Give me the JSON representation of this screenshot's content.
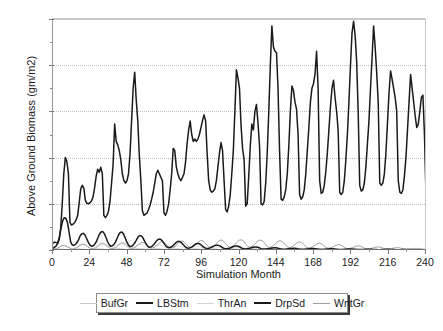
{
  "chart_data": {
    "type": "line",
    "title": "",
    "xlabel": "Simulation Month",
    "ylabel": "Above Ground Biomass (gm/m2)",
    "xlim": [
      0,
      240
    ],
    "ylim": [
      0,
      1000
    ],
    "xticks": [
      0,
      24,
      48,
      72,
      96,
      120,
      144,
      168,
      192,
      216,
      240
    ],
    "yticks": [
      0,
      200,
      400,
      600,
      800,
      1000
    ],
    "yticks_minor": [
      100,
      300,
      500,
      700,
      900
    ],
    "grid": "horizontal-dotted",
    "legend_position": "below-plot",
    "series": [
      {
        "name": "BufGr",
        "color": "#c8c8c8",
        "width": 0.8,
        "values": [
          1,
          2,
          3,
          4,
          5,
          4,
          3,
          2,
          1,
          1,
          1,
          1,
          1,
          2,
          3,
          4,
          5,
          5,
          4,
          3,
          2,
          1,
          1,
          1,
          1,
          2,
          3,
          5,
          6,
          6,
          5,
          4,
          3,
          2,
          1,
          1,
          1,
          2,
          3,
          5,
          6,
          7,
          6,
          5,
          4,
          3,
          2,
          1,
          1,
          2,
          3,
          5,
          6,
          7,
          7,
          6,
          5,
          4,
          3,
          2,
          1,
          2,
          3,
          5,
          6,
          7,
          7,
          6,
          5,
          4,
          3,
          2,
          1,
          2,
          3,
          5,
          6,
          7,
          6,
          5,
          4,
          3,
          2,
          1,
          1,
          2,
          3,
          4,
          6,
          6,
          6,
          5,
          4,
          3,
          2,
          1,
          1,
          2,
          3,
          4,
          5,
          6,
          5,
          4,
          3,
          2,
          2,
          1,
          1,
          2,
          3,
          4,
          5,
          5,
          5,
          4,
          3,
          2,
          1,
          1,
          1,
          2,
          3,
          4,
          5,
          5,
          4,
          4,
          3,
          2,
          1,
          1,
          1,
          2,
          3,
          4,
          4,
          5,
          4,
          3,
          3,
          2,
          1,
          1,
          1,
          2,
          3,
          3,
          4,
          4,
          4,
          3,
          2,
          2,
          1,
          1,
          1,
          2,
          2,
          3,
          3,
          4,
          3,
          3,
          2,
          1,
          1,
          1,
          1,
          2,
          2,
          3,
          3,
          3,
          3,
          2,
          2,
          1,
          1,
          1,
          1,
          2,
          2,
          2,
          3,
          3,
          2,
          2,
          2,
          1,
          1,
          1,
          1,
          1,
          2,
          2,
          2,
          2,
          2,
          2,
          1,
          1,
          1,
          1,
          1,
          1,
          2,
          2,
          2,
          2,
          2,
          2,
          1,
          1,
          1,
          1,
          1,
          1,
          1,
          1,
          2,
          2,
          2,
          2,
          1,
          1,
          1,
          1,
          1,
          1,
          1,
          1,
          1,
          1,
          1
        ]
      },
      {
        "name": "LBStm",
        "color": "#1a1a1a",
        "width": 1.5,
        "values": [
          30,
          34,
          32,
          30,
          45,
          95,
          200,
          330,
          400,
          382,
          330,
          120,
          108,
          112,
          118,
          130,
          150,
          205,
          265,
          280,
          268,
          215,
          202,
          200,
          205,
          212,
          230,
          270,
          320,
          350,
          336,
          358,
          330,
          150,
          140,
          150,
          168,
          210,
          290,
          370,
          545,
          470,
          455,
          430,
          390,
          330,
          300,
          290,
          300,
          330,
          420,
          560,
          700,
          770,
          650,
          560,
          410,
          300,
          170,
          150,
          155,
          160,
          175,
          195,
          220,
          250,
          290,
          330,
          345,
          330,
          315,
          300,
          160,
          150,
          168,
          200,
          260,
          330,
          440,
          430,
          360,
          330,
          310,
          300,
          315,
          330,
          380,
          460,
          520,
          558,
          500,
          470,
          480,
          470,
          480,
          500,
          530,
          560,
          585,
          560,
          420,
          300,
          260,
          250,
          255,
          265,
          300,
          360,
          420,
          465,
          430,
          300,
          175,
          165,
          190,
          240,
          330,
          430,
          600,
          780,
          745,
          700,
          540,
          440,
          390,
          190,
          200,
          320,
          450,
          545,
          520,
          600,
          630,
          550,
          450,
          200,
          195,
          210,
          290,
          420,
          600,
          800,
          970,
          880,
          860,
          855,
          700,
          430,
          220,
          215,
          230,
          260,
          330,
          450,
          600,
          710,
          690,
          640,
          610,
          500,
          240,
          220,
          230,
          260,
          330,
          430,
          530,
          640,
          700,
          720,
          760,
          860,
          700,
          300,
          245,
          250,
          280,
          340,
          420,
          520,
          620,
          700,
          735,
          660,
          600,
          520,
          250,
          240,
          250,
          300,
          390,
          500,
          640,
          800,
          940,
          990,
          930,
          820,
          600,
          280,
          255,
          260,
          290,
          360,
          460,
          560,
          700,
          830,
          970,
          880,
          770,
          640,
          290,
          280,
          290,
          330,
          420,
          550,
          680,
          775,
          740,
          700,
          660,
          600,
          300,
          250,
          245,
          260,
          320,
          400,
          520,
          640,
          760,
          700,
          640,
          580,
          530,
          545,
          600,
          660,
          670,
          500,
          240
        ]
      },
      {
        "name": "ThrAn",
        "color": "#d2d2d2",
        "width": 0.8,
        "values": [
          2,
          3,
          5,
          8,
          12,
          16,
          20,
          22,
          20,
          16,
          12,
          8,
          5,
          6,
          9,
          13,
          18,
          23,
          27,
          28,
          25,
          20,
          14,
          9,
          6,
          8,
          12,
          17,
          22,
          27,
          30,
          30,
          27,
          21,
          15,
          10,
          6,
          8,
          11,
          16,
          21,
          25,
          28,
          28,
          25,
          20,
          14,
          9,
          6,
          7,
          10,
          14,
          18,
          22,
          25,
          25,
          22,
          18,
          13,
          8,
          5,
          6,
          9,
          12,
          16,
          19,
          21,
          21,
          19,
          15,
          11,
          7,
          4,
          5,
          7,
          10,
          13,
          16,
          18,
          18,
          16,
          13,
          9,
          6,
          4,
          5,
          7,
          9,
          12,
          14,
          16,
          16,
          14,
          11,
          8,
          5,
          3,
          4,
          6,
          8,
          10,
          12,
          13,
          13,
          12,
          9,
          7,
          5,
          3,
          4,
          5,
          7,
          9,
          11,
          12,
          12,
          10,
          8,
          6,
          4,
          3,
          3,
          4,
          6,
          8,
          9,
          10,
          10,
          9,
          7,
          5,
          3,
          2,
          3,
          4,
          5,
          7,
          8,
          9,
          9,
          8,
          6,
          4,
          3,
          2,
          2,
          3,
          4,
          5,
          6,
          7,
          7,
          6,
          5,
          4,
          2,
          2,
          2,
          3,
          4,
          5,
          6,
          6,
          6,
          5,
          4,
          3,
          2,
          1,
          2,
          2,
          3,
          4,
          5,
          5,
          5,
          4,
          3,
          2,
          2,
          1,
          1,
          2,
          2,
          3,
          4,
          4,
          4,
          4,
          3,
          2,
          2,
          1,
          1,
          2,
          2,
          3,
          3,
          4,
          3,
          3,
          2,
          2,
          1,
          1,
          1,
          2,
          2,
          2,
          3,
          3,
          3,
          2,
          2,
          1,
          1,
          1,
          1,
          1,
          2,
          2,
          2,
          2,
          2,
          2,
          1,
          1,
          1,
          1,
          1,
          1,
          1,
          1,
          1,
          1
        ]
      },
      {
        "name": "DrpSd",
        "color": "#1a1a1a",
        "width": 1.5,
        "values": [
          8,
          12,
          18,
          30,
          55,
          95,
          125,
          140,
          138,
          120,
          80,
          35,
          22,
          20,
          24,
          32,
          45,
          62,
          70,
          72,
          65,
          50,
          34,
          22,
          16,
          18,
          24,
          35,
          52,
          68,
          78,
          80,
          72,
          56,
          38,
          24,
          16,
          18,
          24,
          34,
          50,
          66,
          76,
          78,
          70,
          54,
          36,
          23,
          15,
          16,
          21,
          30,
          42,
          55,
          62,
          62,
          55,
          42,
          28,
          18,
          12,
          13,
          17,
          24,
          33,
          42,
          47,
          47,
          42,
          32,
          22,
          14,
          10,
          11,
          14,
          19,
          26,
          33,
          37,
          37,
          33,
          26,
          18,
          12,
          8,
          9,
          11,
          15,
          20,
          25,
          28,
          28,
          25,
          19,
          13,
          9,
          6,
          7,
          9,
          12,
          16,
          19,
          21,
          21,
          19,
          15,
          10,
          7,
          5,
          6,
          7,
          10,
          13,
          16,
          17,
          17,
          15,
          12,
          8,
          6,
          4,
          5,
          6,
          8,
          10,
          12,
          13,
          13,
          12,
          9,
          6,
          4,
          4,
          4,
          5,
          6,
          8,
          9,
          10,
          10,
          9,
          7,
          5,
          4,
          3,
          3,
          4,
          5,
          6,
          7,
          8,
          8,
          7,
          5,
          4,
          3,
          3,
          3,
          4,
          4,
          5,
          6,
          6,
          6,
          5,
          4,
          3,
          3,
          2,
          3,
          3,
          4,
          4,
          5,
          5,
          5,
          4,
          3,
          3,
          2,
          2,
          2,
          3,
          3,
          4,
          4,
          4,
          4,
          3,
          3,
          2,
          2,
          2,
          2,
          2,
          3,
          3,
          3,
          3,
          3,
          2,
          2,
          2,
          1,
          1,
          2,
          2,
          2,
          3,
          3,
          3,
          2,
          2,
          2,
          1,
          1,
          1,
          1,
          2,
          2,
          2,
          2,
          2,
          2,
          1,
          1,
          1,
          1,
          1,
          1,
          1,
          1,
          1,
          1
        ]
      },
      {
        "name": "WntGr",
        "color": "#9e9e9e",
        "width": 1.0,
        "values": [
          3,
          4,
          6,
          9,
          13,
          17,
          19,
          19,
          17,
          13,
          9,
          5,
          4,
          5,
          8,
          12,
          17,
          21,
          24,
          24,
          21,
          16,
          11,
          7,
          5,
          6,
          9,
          14,
          19,
          24,
          27,
          27,
          24,
          19,
          13,
          8,
          6,
          7,
          10,
          15,
          21,
          26,
          30,
          30,
          27,
          21,
          15,
          9,
          7,
          8,
          11,
          16,
          22,
          28,
          32,
          33,
          30,
          24,
          17,
          11,
          8,
          9,
          12,
          18,
          24,
          30,
          35,
          36,
          33,
          26,
          19,
          12,
          9,
          10,
          13,
          19,
          26,
          33,
          38,
          39,
          36,
          29,
          21,
          14,
          10,
          11,
          15,
          21,
          28,
          35,
          40,
          41,
          38,
          31,
          22,
          15,
          11,
          12,
          16,
          22,
          29,
          36,
          42,
          43,
          40,
          32,
          24,
          16,
          12,
          13,
          17,
          23,
          30,
          37,
          43,
          44,
          41,
          33,
          24,
          16,
          12,
          13,
          17,
          23,
          30,
          37,
          42,
          43,
          40,
          32,
          24,
          16,
          12,
          12,
          16,
          21,
          28,
          34,
          39,
          40,
          37,
          30,
          22,
          15,
          11,
          11,
          14,
          19,
          24,
          30,
          34,
          35,
          32,
          26,
          19,
          13,
          9,
          9,
          12,
          16,
          20,
          25,
          28,
          29,
          27,
          22,
          16,
          11,
          8,
          8,
          10,
          13,
          17,
          20,
          23,
          23,
          21,
          17,
          12,
          8,
          6,
          6,
          8,
          10,
          13,
          16,
          18,
          18,
          16,
          13,
          9,
          6,
          5,
          5,
          6,
          8,
          10,
          12,
          13,
          13,
          12,
          10,
          7,
          5,
          4,
          4,
          5,
          6,
          8,
          9,
          10,
          10,
          9,
          7,
          5,
          4,
          3,
          3,
          4,
          5,
          6,
          7,
          7,
          7,
          6,
          5,
          4,
          3,
          3
        ]
      }
    ]
  },
  "axes": {
    "y_title": "Above Ground Biomass (gm/m2)",
    "x_title": "Simulation Month",
    "y_tick_labels": [
      "1000",
      "800",
      "600",
      "400",
      "200",
      "0"
    ],
    "x_tick_labels": [
      "0",
      "24",
      "48",
      "72",
      "96",
      "120",
      "144",
      "168",
      "192",
      "216",
      "240"
    ]
  },
  "legend": {
    "items": [
      {
        "label": "BufGr",
        "color": "#c8c8c8",
        "thickness": "1px"
      },
      {
        "label": "LBStm",
        "color": "#1a1a1a",
        "thickness": "2.5px"
      },
      {
        "label": "ThrAn",
        "color": "#d2d2d2",
        "thickness": "1px"
      },
      {
        "label": "DrpSd",
        "color": "#1a1a1a",
        "thickness": "2.5px"
      },
      {
        "label": "WntGr",
        "color": "#9e9e9e",
        "thickness": "1.5px"
      }
    ]
  },
  "colors": {
    "background": "#ffffff",
    "axis": "#7a7a7a",
    "grid": "#c0c0c0",
    "text": "#1a1a1a"
  }
}
